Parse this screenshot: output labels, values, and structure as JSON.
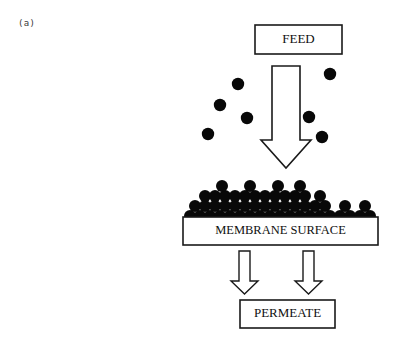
{
  "figure": {
    "panel_label": "(a)",
    "background_color": "#ffffff",
    "ink_color": "#101010",
    "particle_color": "#080808"
  },
  "boxes": [
    {
      "id": "feed",
      "label": "FEED",
      "x": 255,
      "y": 25,
      "width": 87,
      "height": 29,
      "font_size": 13,
      "stroke_width": 1.6
    },
    {
      "id": "membrane",
      "label": "MEMBRANE SURFACE",
      "x": 183,
      "y": 217,
      "width": 195,
      "height": 28,
      "font_size": 12.5,
      "stroke_width": 1.6
    },
    {
      "id": "permeate",
      "label": "PERMEATE",
      "x": 240,
      "y": 300,
      "width": 95,
      "height": 28,
      "font_size": 13,
      "stroke_width": 1.6
    }
  ],
  "arrows": [
    {
      "id": "feed-flow-arrow",
      "name": "feed-flow-arrow",
      "direction": "down",
      "shaft_left": 272,
      "shaft_right": 300,
      "head_left": 261,
      "head_right": 311,
      "top": 66,
      "head_top": 140,
      "tip": 168,
      "stroke_width": 1.6
    },
    {
      "id": "permeate-arrow-left",
      "name": "permeate-flow-arrow-left",
      "direction": "down",
      "shaft_left": 239,
      "shaft_right": 250,
      "head_left": 231,
      "head_right": 258,
      "top": 251,
      "head_top": 281,
      "tip": 294,
      "stroke_width": 1.4
    },
    {
      "id": "permeate-arrow-right",
      "name": "permeate-flow-arrow-right",
      "direction": "down",
      "shaft_left": 303,
      "shaft_right": 314,
      "head_left": 295,
      "head_right": 322,
      "top": 251,
      "head_top": 281,
      "tip": 294,
      "stroke_width": 1.4
    }
  ],
  "suspended_particles": {
    "name": "suspended-feed-particles",
    "radius": 6.2,
    "count": 7,
    "points": [
      {
        "cx": 238,
        "cy": 84
      },
      {
        "cx": 330,
        "cy": 74
      },
      {
        "cx": 220,
        "cy": 105
      },
      {
        "cx": 247,
        "cy": 118
      },
      {
        "cx": 309,
        "cy": 117
      },
      {
        "cx": 208,
        "cy": 134
      },
      {
        "cx": 322,
        "cy": 137
      }
    ]
  },
  "cake_layer": {
    "name": "cake-layer-particles",
    "description": "Deposited particle cake mound on membrane surface",
    "radius": 6.0,
    "rows": [
      {
        "y": 216,
        "xs": [
          190,
          200,
          210,
          220,
          230,
          240,
          250,
          260,
          270,
          280,
          290,
          300,
          310,
          320,
          330,
          340,
          350,
          360,
          370
        ]
      },
      {
        "y": 206,
        "xs": [
          195,
          205,
          215,
          225,
          235,
          245,
          255,
          265,
          275,
          285,
          295,
          305,
          315,
          325,
          345,
          365
        ]
      },
      {
        "y": 196,
        "xs": [
          205,
          215,
          225,
          235,
          245,
          255,
          265,
          275,
          285,
          295,
          305,
          320
        ]
      },
      {
        "y": 186,
        "xs": [
          222,
          250,
          278,
          300
        ]
      }
    ]
  }
}
